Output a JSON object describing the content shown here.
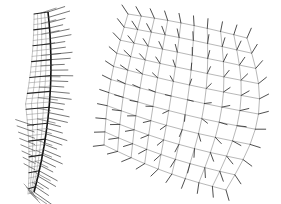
{
  "figure": {
    "width": 281,
    "height": 204,
    "background": "#ffffff",
    "panels": [
      {
        "id": "left",
        "description": "curved strip mesh with dense normal vectors (side view)",
        "grid_color": "#8a8a8a",
        "vector_color": "#1a1a1a",
        "spine_color": "#111111",
        "rows": 34,
        "cols": 4,
        "top": 12,
        "bottom": 192,
        "spine": {
          "x_top": 48,
          "x_mid": 58,
          "x_bottom": 34,
          "bulge": 0
        },
        "width_top": 14,
        "width_mid": 24,
        "width_bottom": 6,
        "vector_length": 22,
        "vector_angle_top_deg": -18,
        "vector_angle_bottom_deg": 35
      },
      {
        "id": "right",
        "description": "warped quad grid mesh with normal vectors (front view)",
        "grid_color": "#9a9a9a",
        "vector_color": "#222222",
        "rows": 11,
        "cols": 10,
        "corners": {
          "top_left": [
            128,
            14
          ],
          "top_right": [
            247,
            38
          ],
          "bottom_left": [
            104,
            145
          ],
          "bottom_right": [
            226,
            190
          ]
        },
        "bulge_right": [
          22,
          0
        ],
        "bulge_top": [
          0,
          0
        ],
        "vector_length": 9
      }
    ]
  }
}
